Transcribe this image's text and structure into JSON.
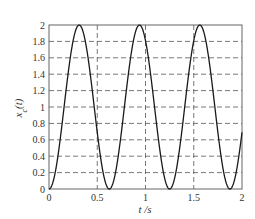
{
  "chart_data": {
    "type": "line",
    "title": "",
    "xlabel": "t /s",
    "ylabel": "x_c(t)",
    "xlim": [
      0,
      2
    ],
    "ylim": [
      0,
      2
    ],
    "xticks": [
      "0",
      "0.5",
      "1",
      "1.5",
      "2"
    ],
    "yticks": [
      "0",
      "0.2",
      "0.4",
      "0.6",
      "0.8",
      "1",
      "1.2",
      "1.4",
      "1.6",
      "1.8",
      "2"
    ],
    "grid": true,
    "grid_style": "dashed",
    "legend": null,
    "series": [
      {
        "name": "x_c(t)",
        "description": "periodic waveform ≈ 1 - cos(2π·1.6·t), peaks ≈2 at t≈0.31, 0.94, 1.56; minima ≈0 at t≈0, 0.62, 1.25, 1.87",
        "x": [
          0,
          0.05,
          0.1,
          0.15,
          0.2,
          0.25,
          0.3,
          0.35,
          0.4,
          0.45,
          0.5,
          0.55,
          0.6,
          0.65,
          0.7,
          0.75,
          0.8,
          0.85,
          0.9,
          0.95,
          1.0,
          1.05,
          1.1,
          1.15,
          1.2,
          1.25,
          1.3,
          1.35,
          1.4,
          1.45,
          1.5,
          1.55,
          1.6,
          1.65,
          1.7,
          1.75,
          1.8,
          1.85,
          1.9,
          1.95,
          2.0
        ],
        "values": [
          0,
          0.19,
          0.69,
          1.31,
          1.81,
          2.0,
          1.81,
          1.31,
          0.69,
          0.19,
          0,
          0.19,
          0.69,
          1.31,
          1.81,
          2.0,
          1.81,
          1.31,
          0.69,
          0.19,
          0,
          0.19,
          0.69,
          1.31,
          1.81,
          2.0,
          1.81,
          1.31,
          0.69,
          0.19,
          0,
          0.19,
          0.69,
          1.31,
          1.81,
          2.0,
          1.81,
          1.31,
          0.69,
          0.19,
          0.69
        ]
      }
    ],
    "model": {
      "form": "1 - cos(2*pi*f*t)",
      "f": 1.6,
      "amplitude": 1,
      "offset": 1
    }
  },
  "colors": {
    "line": "#1a1a1a",
    "grid": "#555555",
    "axis": "#555555",
    "background": "#ffffff"
  }
}
